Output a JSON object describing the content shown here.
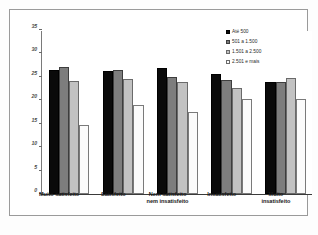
{
  "chart_data": {
    "type": "bar",
    "title": "",
    "subtitle": "",
    "xlabel": "",
    "ylabel": "",
    "ylim": [
      0,
      35
    ],
    "yticks": [
      0,
      5,
      10,
      15,
      20,
      25,
      30,
      35
    ],
    "ytick_labels": [
      "0",
      "5",
      "10",
      "15",
      "20",
      "25",
      "30",
      "35"
    ],
    "grid": false,
    "legend_position": "top-right",
    "categories": [
      "Muito satisfeito",
      "Satisfeito",
      "Nem satisfeito nem insatisfeito",
      "Insatisfeito",
      "Muito insatisfeito"
    ],
    "category_lines": [
      [
        "Muito satisfeito"
      ],
      [
        "Satisfeito"
      ],
      [
        "Nem satisfeito",
        "nem insatisfeito"
      ],
      [
        "Insatisfeito"
      ],
      [
        "Muito",
        "insatisfeito"
      ]
    ],
    "series": [
      {
        "name": "Até 500",
        "color": "#0a0a0a",
        "values": [
          26.5,
          26.3,
          27.0,
          25.7,
          24.0
        ]
      },
      {
        "name": "501 a 1.500",
        "color": "#7d7d7d",
        "values": [
          27.2,
          26.4,
          25.0,
          24.3,
          24.0
        ]
      },
      {
        "name": "1.501 a 2.500",
        "color": "#c2c2c2",
        "values": [
          24.2,
          24.6,
          23.9,
          22.6,
          24.7
        ]
      },
      {
        "name": "2.501 e mais",
        "color": "#fbfbfb",
        "values": [
          14.7,
          19.1,
          17.6,
          20.2,
          20.3
        ]
      }
    ]
  }
}
